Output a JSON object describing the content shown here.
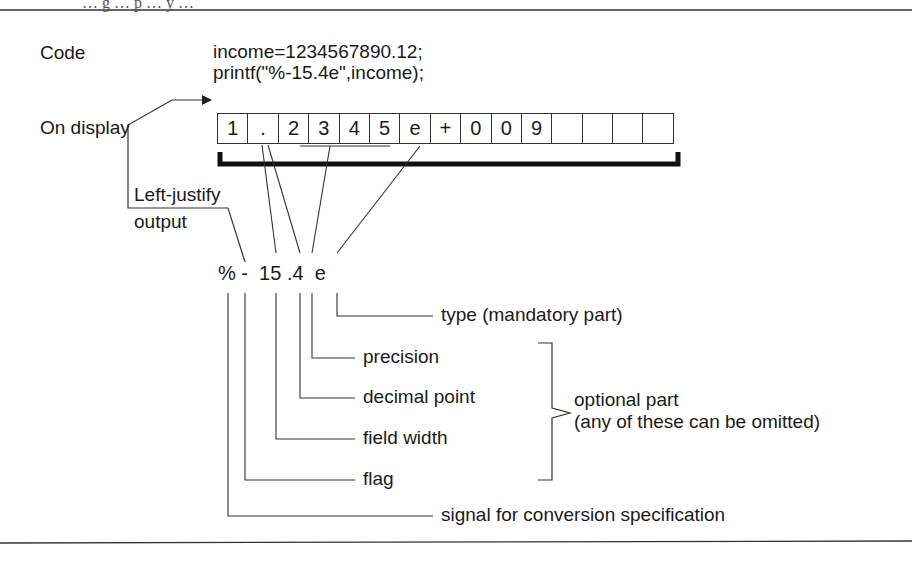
{
  "figure": {
    "top_caption_partial": "… g … p … y …",
    "code_label": "Code",
    "code_lines": [
      "income=1234567890.12;",
      "printf(\"%-15.4e\",income);"
    ],
    "display_label": "On display",
    "display_cells": [
      "1",
      ".",
      "2",
      "3",
      "4",
      "5",
      "e",
      "+",
      "0",
      "0",
      "9",
      "",
      "",
      "",
      ""
    ],
    "left_justify_label_line1": "Left-justify",
    "left_justify_label_line2": "output",
    "format_spec": "% -  15 .4  e",
    "parts": {
      "type": "type (mandatory part)",
      "precision": "precision",
      "decimal_point": "decimal point",
      "field_width": "field width",
      "flag": "flag",
      "signal": "signal for conversion specification"
    },
    "optional_line1": "optional part",
    "optional_line2": "(any of these can be omitted)",
    "colors": {
      "ink": "#1a1a1a",
      "background": "#ffffff"
    }
  }
}
